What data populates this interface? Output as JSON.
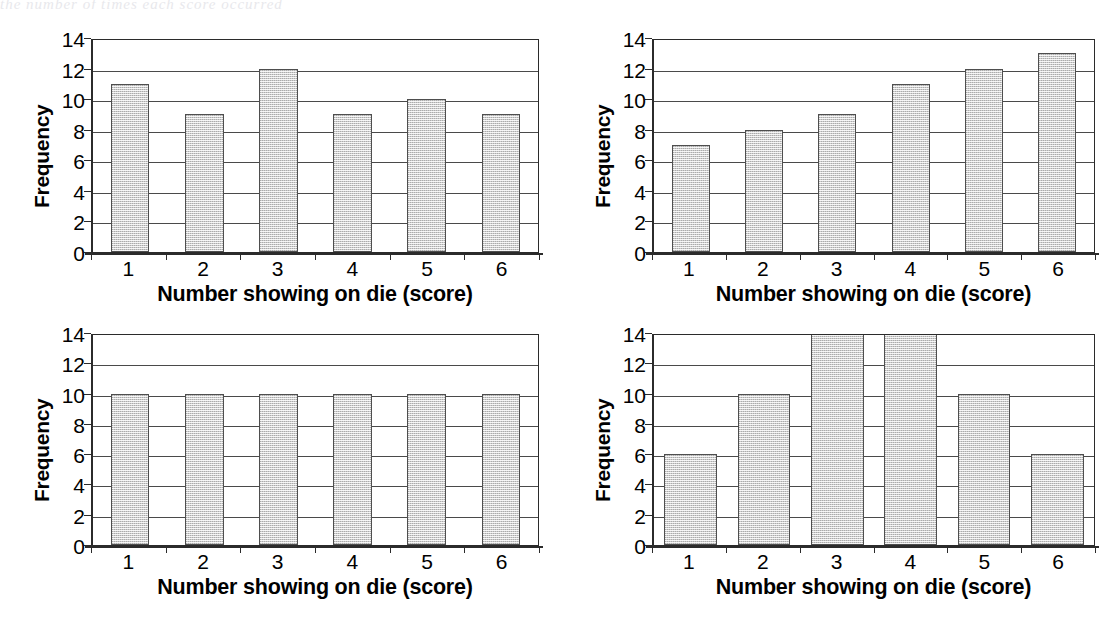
{
  "page": {
    "top_bleed_text": "the number of times each score occurred",
    "axis": {
      "y_title": "Frequency",
      "x_title": "Number showing on die (score)",
      "y_ticks": [
        "0",
        "2",
        "4",
        "6",
        "8",
        "10",
        "12",
        "14"
      ],
      "x_ticks": [
        "1",
        "2",
        "3",
        "4",
        "5",
        "6"
      ]
    },
    "colors": {
      "bar_fill": "#cdcdcd",
      "bar_outline": "#4e4e4e",
      "axis": "#2b2b2b",
      "gridline": "#4a4a4a",
      "text": "#000000",
      "background": "#ffffff"
    }
  },
  "chart_data": [
    {
      "type": "bar",
      "id": "chart-top-left",
      "title": "",
      "xlabel": "Number showing on die (score)",
      "ylabel": "Frequency",
      "categories": [
        "1",
        "2",
        "3",
        "4",
        "5",
        "6"
      ],
      "values": [
        11,
        9,
        12,
        9,
        10,
        9
      ],
      "ylim": [
        0,
        14
      ],
      "ytick_step": 2,
      "grid": true,
      "legend": "none",
      "bar_width_ratio": 0.52
    },
    {
      "type": "bar",
      "id": "chart-top-right",
      "title": "",
      "xlabel": "Number showing on die (score)",
      "ylabel": "Frequency",
      "categories": [
        "1",
        "2",
        "3",
        "4",
        "5",
        "6"
      ],
      "values": [
        7,
        8,
        9,
        11,
        12,
        13
      ],
      "ylim": [
        0,
        14
      ],
      "ytick_step": 2,
      "grid": true,
      "legend": "none",
      "bar_width_ratio": 0.52
    },
    {
      "type": "bar",
      "id": "chart-bottom-left",
      "title": "",
      "xlabel": "Number showing on die (score)",
      "ylabel": "Frequency",
      "categories": [
        "1",
        "2",
        "3",
        "4",
        "5",
        "6"
      ],
      "values": [
        10,
        10,
        10,
        10,
        10,
        10
      ],
      "ylim": [
        0,
        14
      ],
      "ytick_step": 2,
      "grid": true,
      "legend": "none",
      "bar_width_ratio": 0.52
    },
    {
      "type": "bar",
      "id": "chart-bottom-right",
      "title": "",
      "xlabel": "Number showing on die (score)",
      "ylabel": "Frequency",
      "categories": [
        "1",
        "2",
        "3",
        "4",
        "5",
        "6"
      ],
      "values": [
        6,
        10,
        14,
        14,
        10,
        6
      ],
      "ylim": [
        0,
        14
      ],
      "ytick_step": 2,
      "grid": true,
      "legend": "none",
      "bar_width_ratio": 0.72
    }
  ]
}
